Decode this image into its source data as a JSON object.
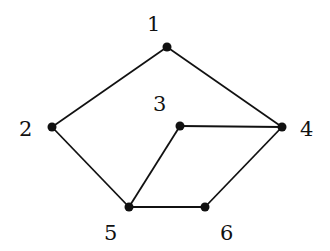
{
  "graph": {
    "nodes": [
      {
        "id": "1",
        "label": "1",
        "x": 167,
        "y": 47,
        "lx": 147,
        "ly": 31
      },
      {
        "id": "2",
        "label": "2",
        "x": 52,
        "y": 127,
        "lx": 19,
        "ly": 136
      },
      {
        "id": "3",
        "label": "3",
        "x": 180,
        "y": 126,
        "lx": 153,
        "ly": 111
      },
      {
        "id": "4",
        "label": "4",
        "x": 282,
        "y": 127,
        "lx": 300,
        "ly": 136
      },
      {
        "id": "5",
        "label": "5",
        "x": 129,
        "y": 207,
        "lx": 104,
        "ly": 240
      },
      {
        "id": "6",
        "label": "6",
        "x": 205,
        "y": 207,
        "lx": 220,
        "ly": 240
      }
    ],
    "edges": [
      [
        "1",
        "2"
      ],
      [
        "1",
        "4"
      ],
      [
        "2",
        "5"
      ],
      [
        "3",
        "4"
      ],
      [
        "3",
        "5"
      ],
      [
        "4",
        "6"
      ],
      [
        "5",
        "6"
      ]
    ]
  }
}
